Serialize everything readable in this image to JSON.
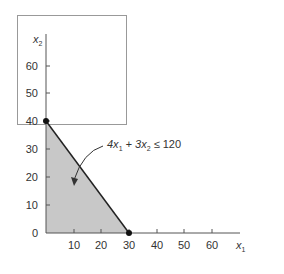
{
  "diagram": {
    "axes": {
      "x_label": "x",
      "x_label_sub": "1",
      "y_label": "x",
      "y_label_sub": "2",
      "x_ticks": [
        "10",
        "20",
        "30",
        "40",
        "50",
        "60"
      ],
      "y_ticks": [
        "0",
        "10",
        "20",
        "30",
        "40",
        "50",
        "60"
      ]
    },
    "constraint": {
      "label_part1": "4x",
      "label_sub1": "1",
      "label_part2": " + 3x",
      "label_sub2": "2",
      "label_part3": " ≤ 120"
    },
    "feasible_region": {
      "vertices": [
        [
          0,
          0
        ],
        [
          30,
          0
        ],
        [
          0,
          40
        ]
      ],
      "fill_color": "#c8c8c8"
    },
    "points": [
      {
        "x": 0,
        "y": 40
      },
      {
        "x": 30,
        "y": 0
      }
    ],
    "colors": {
      "line": "#222222",
      "frame": "#999999"
    }
  }
}
